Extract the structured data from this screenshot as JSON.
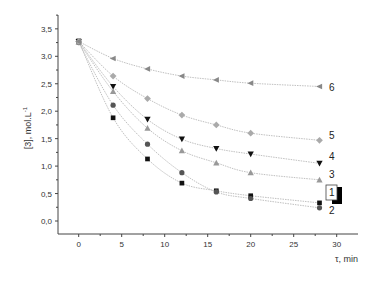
{
  "chart_data": {
    "type": "scatter",
    "title": "",
    "xlabel": "τ, min",
    "ylabel": "[3], mol.L",
    "ylabel_superscript": "-1",
    "xlim": [
      -3,
      32.5
    ],
    "ylim": [
      -0.25,
      3.75
    ],
    "x_ticks": [
      0,
      5,
      10,
      15,
      20,
      25,
      30
    ],
    "x_tick_labels": [
      "0",
      "5",
      "10",
      "15",
      "20",
      "25",
      "30"
    ],
    "y_ticks": [
      0.0,
      0.5,
      1.0,
      1.5,
      2.0,
      2.5,
      3.0,
      3.5
    ],
    "y_tick_labels": [
      "0,0",
      "0,5",
      "1,0",
      "1,5",
      "2,0",
      "2,5",
      "3,0",
      "3,5"
    ],
    "grid": false,
    "legend": "inline labels at right end of curves",
    "x": [
      0,
      4,
      8,
      12,
      16,
      20,
      28
    ],
    "series": [
      {
        "name": "1",
        "marker": "square",
        "color": "#111111",
        "boxed_label": true,
        "values": [
          3.28,
          1.88,
          1.13,
          0.69,
          0.55,
          0.46,
          0.33
        ]
      },
      {
        "name": "2",
        "marker": "circle",
        "color": "#555555",
        "values": [
          3.25,
          2.11,
          1.4,
          0.88,
          0.53,
          0.41,
          0.24
        ]
      },
      {
        "name": "3",
        "marker": "triangle-up",
        "color": "#999999",
        "values": [
          3.26,
          2.36,
          1.69,
          1.28,
          1.06,
          0.88,
          0.75
        ]
      },
      {
        "name": "4",
        "marker": "triangle-down",
        "color": "#111111",
        "values": [
          3.27,
          2.45,
          1.85,
          1.49,
          1.32,
          1.22,
          1.05
        ]
      },
      {
        "name": "5",
        "marker": "diamond",
        "color": "#aaaaaa",
        "values": [
          3.27,
          2.64,
          2.23,
          1.93,
          1.75,
          1.6,
          1.47
        ]
      },
      {
        "name": "6",
        "marker": "triangle-left",
        "color": "#888888",
        "values": [
          3.27,
          2.96,
          2.77,
          2.64,
          2.57,
          2.51,
          2.45
        ]
      }
    ]
  }
}
